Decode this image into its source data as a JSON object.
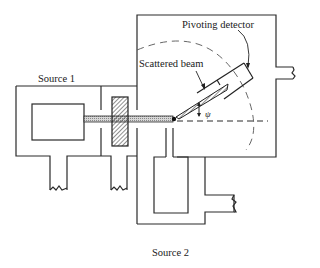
{
  "diagram": {
    "labels": {
      "source1": "Source 1",
      "source2": "Source 2",
      "scattered_beam": "Scattered beam",
      "pivoting_detector": "Pivoting detector",
      "angle_symbol": "ψ"
    },
    "colors": {
      "line": "#2a2a2a",
      "background": "#ffffff",
      "beam_fill": "#bdbdbd"
    }
  }
}
